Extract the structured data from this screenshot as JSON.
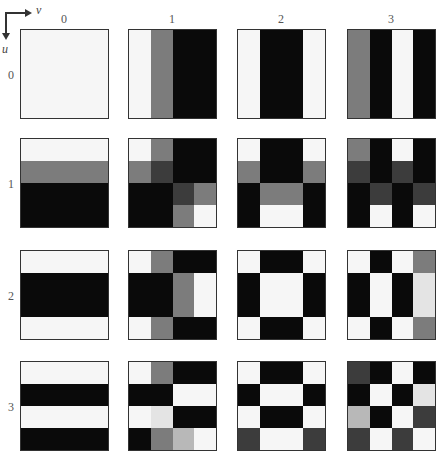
{
  "axes": {
    "horizontal_label": "v",
    "vertical_label": "u"
  },
  "column_labels": [
    "0",
    "1",
    "2",
    "3"
  ],
  "row_labels": [
    "0",
    "1",
    "2",
    "3"
  ],
  "colors": {
    "W": "#f6f6f6",
    "LW": "#e4e4e4",
    "LG": "#b8b8b8",
    "G": "#7c7c7c",
    "DG": "#3c3c3c",
    "B": "#0a0a0a"
  },
  "tiles": [
    [
      [
        [
          "W",
          "W",
          "W",
          "W"
        ],
        [
          "W",
          "W",
          "W",
          "W"
        ],
        [
          "W",
          "W",
          "W",
          "W"
        ],
        [
          "W",
          "W",
          "W",
          "W"
        ]
      ],
      [
        [
          "W",
          "G",
          "B",
          "B"
        ],
        [
          "W",
          "G",
          "B",
          "B"
        ],
        [
          "W",
          "G",
          "B",
          "B"
        ],
        [
          "W",
          "G",
          "B",
          "B"
        ]
      ],
      [
        [
          "W",
          "B",
          "B",
          "W"
        ],
        [
          "W",
          "B",
          "B",
          "W"
        ],
        [
          "W",
          "B",
          "B",
          "W"
        ],
        [
          "W",
          "B",
          "B",
          "W"
        ]
      ],
      [
        [
          "G",
          "B",
          "W",
          "B"
        ],
        [
          "G",
          "B",
          "W",
          "B"
        ],
        [
          "G",
          "B",
          "W",
          "B"
        ],
        [
          "G",
          "B",
          "W",
          "B"
        ]
      ]
    ],
    [
      [
        [
          "W",
          "W",
          "W",
          "W"
        ],
        [
          "G",
          "G",
          "G",
          "G"
        ],
        [
          "B",
          "B",
          "B",
          "B"
        ],
        [
          "B",
          "B",
          "B",
          "B"
        ]
      ],
      [
        [
          "W",
          "G",
          "B",
          "B"
        ],
        [
          "G",
          "DG",
          "B",
          "B"
        ],
        [
          "B",
          "B",
          "DG",
          "G"
        ],
        [
          "B",
          "B",
          "G",
          "W"
        ]
      ],
      [
        [
          "W",
          "B",
          "B",
          "W"
        ],
        [
          "G",
          "B",
          "B",
          "G"
        ],
        [
          "B",
          "G",
          "G",
          "B"
        ],
        [
          "B",
          "W",
          "W",
          "B"
        ]
      ],
      [
        [
          "G",
          "B",
          "W",
          "B"
        ],
        [
          "DG",
          "B",
          "DG",
          "B"
        ],
        [
          "B",
          "DG",
          "B",
          "DG"
        ],
        [
          "B",
          "W",
          "B",
          "W"
        ]
      ]
    ],
    [
      [
        [
          "W",
          "W",
          "W",
          "W"
        ],
        [
          "B",
          "B",
          "B",
          "B"
        ],
        [
          "B",
          "B",
          "B",
          "B"
        ],
        [
          "W",
          "W",
          "W",
          "W"
        ]
      ],
      [
        [
          "W",
          "G",
          "B",
          "B"
        ],
        [
          "B",
          "B",
          "G",
          "W"
        ],
        [
          "B",
          "B",
          "G",
          "W"
        ],
        [
          "W",
          "G",
          "B",
          "B"
        ]
      ],
      [
        [
          "W",
          "B",
          "B",
          "W"
        ],
        [
          "B",
          "W",
          "W",
          "B"
        ],
        [
          "B",
          "W",
          "W",
          "B"
        ],
        [
          "W",
          "B",
          "B",
          "W"
        ]
      ],
      [
        [
          "W",
          "B",
          "W",
          "G"
        ],
        [
          "B",
          "W",
          "B",
          "LW"
        ],
        [
          "B",
          "W",
          "B",
          "LW"
        ],
        [
          "W",
          "B",
          "W",
          "G"
        ]
      ]
    ],
    [
      [
        [
          "W",
          "W",
          "W",
          "W"
        ],
        [
          "B",
          "B",
          "B",
          "B"
        ],
        [
          "W",
          "W",
          "W",
          "W"
        ],
        [
          "B",
          "B",
          "B",
          "B"
        ]
      ],
      [
        [
          "W",
          "G",
          "B",
          "B"
        ],
        [
          "B",
          "B",
          "W",
          "W"
        ],
        [
          "W",
          "LW",
          "B",
          "B"
        ],
        [
          "B",
          "G",
          "LG",
          "W"
        ]
      ],
      [
        [
          "W",
          "B",
          "B",
          "W"
        ],
        [
          "B",
          "W",
          "W",
          "B"
        ],
        [
          "W",
          "B",
          "B",
          "W"
        ],
        [
          "DG",
          "W",
          "W",
          "DG"
        ]
      ],
      [
        [
          "DG",
          "B",
          "W",
          "B"
        ],
        [
          "B",
          "W",
          "B",
          "LW"
        ],
        [
          "LG",
          "B",
          "W",
          "DG"
        ],
        [
          "DG",
          "W",
          "DG",
          "W"
        ]
      ]
    ]
  ],
  "layout": {
    "col_x": [
      20,
      128,
      237,
      347
    ],
    "row_y": [
      29,
      138,
      250,
      361
    ]
  }
}
